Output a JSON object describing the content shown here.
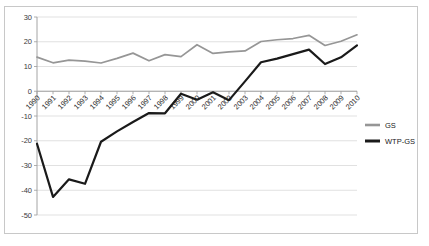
{
  "chart_data": {
    "type": "line",
    "title": "",
    "subtitle": "",
    "xlabel": "",
    "ylabel": "",
    "categories": [
      "1990",
      "1991",
      "1992",
      "1993",
      "1994",
      "1995",
      "1996",
      "1997",
      "1998",
      "1999",
      "2000",
      "2001",
      "2002",
      "2003",
      "2004",
      "2005",
      "2006",
      "2007",
      "2008",
      "2009",
      "2010"
    ],
    "series": [
      {
        "name": "GS",
        "color": "#969696",
        "values": [
          13.8,
          11.5,
          12.6,
          12.2,
          11.4,
          13.3,
          15.4,
          12.3,
          14.8,
          14.0,
          18.8,
          15.3,
          15.9,
          16.3,
          20.1,
          20.8,
          21.3,
          22.6,
          18.5,
          20.2,
          22.8
        ]
      },
      {
        "name": "WTP-GS",
        "color": "#1a1a1a",
        "values": [
          -21.2,
          -42.7,
          -35.6,
          -37.4,
          -20.4,
          -16.2,
          -12.4,
          -8.8,
          -8.9,
          -1.0,
          -3.4,
          -0.4,
          -3.6,
          4.0,
          11.7,
          13.2,
          15.0,
          16.8,
          11.0,
          13.7,
          18.5
        ]
      }
    ],
    "ylim": [
      -50,
      30
    ],
    "yticks": [
      "30",
      "20",
      "10",
      "0",
      "-10",
      "-20",
      "-30",
      "-40",
      "-50"
    ],
    "grid": true,
    "legend_position": "right",
    "xtick_rotation": 45
  },
  "legend": {
    "entries": [
      {
        "label": "GS"
      },
      {
        "label": "WTP-GS"
      }
    ]
  }
}
